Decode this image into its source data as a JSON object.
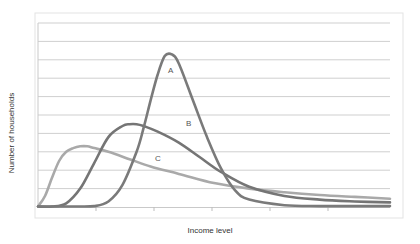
{
  "chart_data": {
    "type": "line",
    "title": "",
    "xlabel": "Income level",
    "ylabel": "Number of households",
    "grid": true,
    "gridlines_y": 10,
    "legend": "inline labels",
    "x_tick_labels": [],
    "y_tick_labels": [],
    "x_range": [
      0,
      100
    ],
    "y_range": [
      0,
      10
    ],
    "series": [
      {
        "name": "A",
        "color": "#7a7a7a",
        "x": [
          0,
          10,
          16,
          20,
          24,
          28,
          30,
          32,
          34,
          36,
          38,
          40,
          44,
          48,
          52,
          56,
          60,
          70,
          80,
          90,
          100
        ],
        "values": [
          0,
          0,
          0.05,
          0.3,
          1.2,
          3.0,
          4.3,
          5.8,
          7.2,
          8.2,
          8.3,
          7.8,
          5.8,
          3.8,
          2.1,
          0.9,
          0.4,
          0.1,
          0.05,
          0.05,
          0.05
        ]
      },
      {
        "name": "B",
        "color": "#757575",
        "x": [
          0,
          4,
          8,
          12,
          16,
          20,
          24,
          26,
          28,
          30,
          34,
          40,
          46,
          52,
          60,
          70,
          80,
          90,
          100
        ],
        "values": [
          0,
          0,
          0.2,
          1.0,
          2.4,
          3.8,
          4.4,
          4.5,
          4.5,
          4.4,
          4.1,
          3.5,
          2.7,
          1.9,
          1.1,
          0.6,
          0.4,
          0.3,
          0.25
        ]
      },
      {
        "name": "C",
        "color": "#a9a9a9",
        "x": [
          0,
          2,
          4,
          6,
          8,
          10,
          12,
          14,
          16,
          20,
          26,
          32,
          40,
          50,
          60,
          70,
          80,
          90,
          100
        ],
        "values": [
          0,
          0.6,
          1.6,
          2.5,
          3.0,
          3.2,
          3.3,
          3.3,
          3.2,
          3.0,
          2.6,
          2.2,
          1.8,
          1.3,
          1.0,
          0.8,
          0.65,
          0.55,
          0.45
        ]
      }
    ],
    "annotations": [
      {
        "text": "A",
        "series": "A"
      },
      {
        "text": "B",
        "series": "B"
      },
      {
        "text": "C",
        "series": "C"
      }
    ]
  },
  "labels": {
    "y_axis": "Number of households",
    "x_axis": "Income level",
    "curve_a": "A",
    "curve_b": "B",
    "curve_c": "C"
  },
  "colors": {
    "grid": "#cfcfcf",
    "axis": "#bdbdbd",
    "border": "#e2e2e2",
    "curve_a": "#7a7a7a",
    "curve_b": "#757575",
    "curve_c": "#a9a9a9"
  }
}
